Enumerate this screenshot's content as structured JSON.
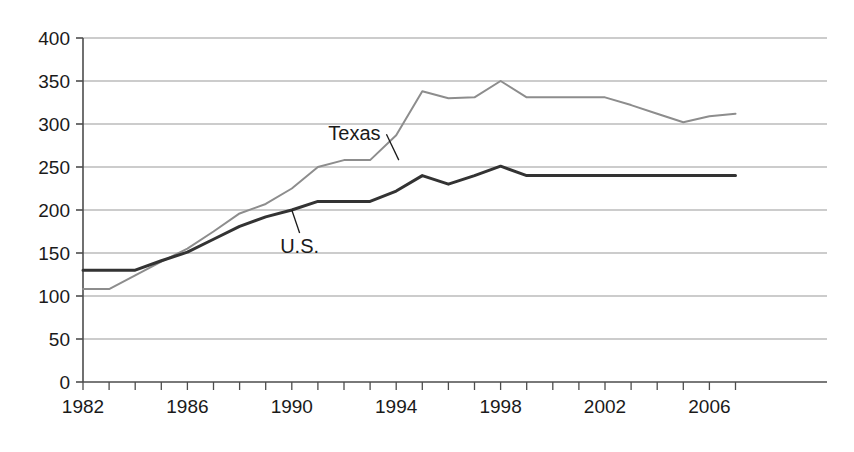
{
  "chart_data": {
    "type": "line",
    "title": "",
    "subtitle": "",
    "xlabel": "",
    "ylabel": "",
    "xlim": [
      1982,
      2007
    ],
    "ylim": [
      0,
      400
    ],
    "ytick_step": 50,
    "xtick_step": 1,
    "xtick_label_step": 4,
    "grid": "horizontal",
    "legend_position": "inline-annotations",
    "x": [
      1982,
      1983,
      1984,
      1985,
      1986,
      1987,
      1988,
      1989,
      1990,
      1991,
      1992,
      1993,
      1994,
      1995,
      1996,
      1997,
      1998,
      1999,
      2000,
      2001,
      2002,
      2003,
      2004,
      2005,
      2006,
      2007
    ],
    "x_tick_labels": [
      "1982",
      "",
      "",
      "",
      "1986",
      "",
      "",
      "",
      "1990",
      "",
      "",
      "",
      "1994",
      "",
      "",
      "",
      "1998",
      "",
      "",
      "",
      "2002",
      "",
      "",
      "",
      "2006",
      ""
    ],
    "y_tick_labels": [
      "0",
      "50",
      "100",
      "150",
      "200",
      "250",
      "300",
      "350",
      "400"
    ],
    "y_tick_values": [
      0,
      50,
      100,
      150,
      200,
      250,
      300,
      350,
      400
    ],
    "series": [
      {
        "name": "Texas",
        "color": "#8d8d8d",
        "width": 2,
        "values": [
          108,
          108,
          124,
          140,
          155,
          175,
          196,
          207,
          225,
          250,
          258,
          258,
          287,
          338,
          330,
          331,
          350,
          331,
          331,
          331,
          331,
          322,
          312,
          302,
          309,
          312
        ],
        "label": "Texas",
        "label_x": 1992.4,
        "label_y": 281,
        "leader_to_x": 1994.1,
        "leader_to_y": 258
      },
      {
        "name": "U.S.",
        "color": "#333333",
        "width": 3,
        "values": [
          130,
          130,
          130,
          141,
          151,
          166,
          181,
          192,
          200,
          210,
          210,
          210,
          222,
          240,
          230,
          240,
          251,
          240,
          240,
          240,
          240,
          240,
          240,
          240,
          240,
          240
        ],
        "label": "U.S.",
        "label_x": 1990.3,
        "label_y": 150,
        "leader_to_x": 1990.0,
        "leader_to_y": 200
      }
    ]
  },
  "axes": {
    "axis_color": "#4d4d4d",
    "grid_color": "#999999",
    "background": "#ffffff"
  }
}
